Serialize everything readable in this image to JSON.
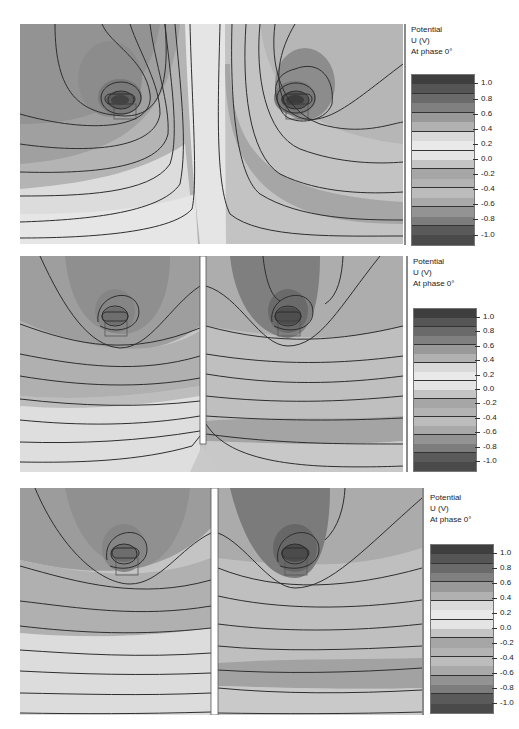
{
  "chart_data": [
    {
      "type": "heatmap",
      "subtype": "filled-contour",
      "title": "Potential U (V) At phase 0°",
      "panel": "top",
      "description": "Two conductors with a common central grounded boundary; potential diverges upward near center",
      "colorbar": {
        "label_lines": [
          "Potential",
          "U (V)",
          "At phase 0°"
        ],
        "ticks": [
          1.0,
          0.8,
          0.6,
          0.4,
          0.2,
          0.0,
          -0.2,
          -0.4,
          -0.6,
          -0.8,
          -1.0
        ],
        "range": [
          -1.0,
          1.0
        ]
      },
      "contour_levels": [
        -1.0,
        -0.8,
        -0.6,
        -0.4,
        -0.2,
        0.0,
        0.2,
        0.4,
        0.6,
        0.8,
        1.0
      ],
      "sources": [
        {
          "x": 0.25,
          "y": 0.27
        },
        {
          "x": 0.71,
          "y": 0.27
        }
      ],
      "separator": "none (central field seam)"
    },
    {
      "type": "heatmap",
      "subtype": "filled-contour",
      "title": "Potential U (V) At phase 0°",
      "panel": "middle",
      "description": "Two conductors separated by a partial vertical shield (gap near bottom)",
      "colorbar": {
        "label_lines": [
          "Potential",
          "U (V)",
          "At phase 0°"
        ],
        "ticks": [
          1.0,
          0.8,
          0.6,
          0.4,
          0.2,
          0.0,
          -0.2,
          -0.4,
          -0.6,
          -0.8,
          -1.0
        ],
        "range": [
          -1.0,
          1.0
        ]
      },
      "contour_levels": [
        -1.0,
        -0.8,
        -0.6,
        -0.4,
        -0.2,
        0.0,
        0.2,
        0.4,
        0.6,
        0.8,
        1.0
      ],
      "sources": [
        {
          "x": 0.26,
          "y": 0.28
        },
        {
          "x": 0.71,
          "y": 0.28
        }
      ],
      "separator": "vertical shield ending ~0.87 of height"
    },
    {
      "type": "heatmap",
      "subtype": "filled-contour",
      "title": "Potential U (V) At phase 0°",
      "panel": "bottom",
      "description": "Two conductors separated by a full-height vertical shield",
      "colorbar": {
        "label_lines": [
          "Potential",
          "U (V)",
          "At phase 0°"
        ],
        "ticks": [
          1.0,
          0.8,
          0.6,
          0.4,
          0.2,
          0.0,
          -0.2,
          -0.4,
          -0.6,
          -0.8,
          -1.0
        ],
        "range": [
          -1.0,
          1.0
        ]
      },
      "contour_levels": [
        -1.0,
        -0.8,
        -0.6,
        -0.4,
        -0.2,
        0.0,
        0.2,
        0.4,
        0.6,
        0.8,
        1.0
      ],
      "sources": [
        {
          "x": 0.26,
          "y": 0.29
        },
        {
          "x": 0.73,
          "y": 0.28
        }
      ],
      "separator": "vertical shield full height"
    }
  ],
  "legend": {
    "title_line1": "Potential",
    "title_line2": "U (V)",
    "title_line3": "At phase 0°",
    "ticks": [
      "1.0",
      "0.8",
      "0.6",
      "0.4",
      "0.2",
      "0.0",
      "-0.2",
      "-0.4",
      "-0.6",
      "-0.8",
      "-1.0"
    ],
    "band_colors": [
      "#3e3e3e",
      "#555555",
      "#6a6a6a",
      "#808080",
      "#999999",
      "#b1b1b1",
      "#dadada",
      "#e9e9e9",
      "#e4e4e4",
      "#c4c4c4",
      "#a6a6a6",
      "#b3b3b3",
      "#bcbcbc",
      "#a9a9a9",
      "#939393",
      "#7d7d7d",
      "#5a5a5a",
      "#4a4a4a"
    ]
  },
  "colors": {
    "contour_line": "#2e2e2e",
    "shield": "#ffffff",
    "plot_border": "#8a8a8a"
  }
}
